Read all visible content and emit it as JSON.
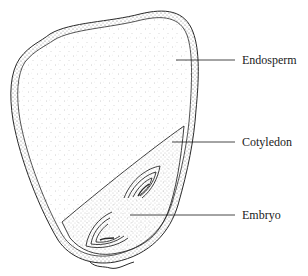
{
  "figure": {
    "colors": {
      "ink": "#2a2a2a",
      "stipple": "#8a8a8a",
      "background": "#ffffff"
    }
  },
  "labels": [
    {
      "id": "endosperm",
      "text": "Endosperm",
      "x": 242,
      "y": 53,
      "line": {
        "x1": 176,
        "y1": 60,
        "x2": 235,
        "y2": 60
      }
    },
    {
      "id": "cotyledon",
      "text": "Cotyledon",
      "x": 242,
      "y": 135,
      "line": {
        "x1": 172,
        "y1": 142,
        "x2": 235,
        "y2": 142
      }
    },
    {
      "id": "embryo",
      "text": "Embryo",
      "x": 242,
      "y": 208,
      "line": {
        "x1": 130,
        "y1": 215,
        "x2": 235,
        "y2": 215
      }
    }
  ]
}
